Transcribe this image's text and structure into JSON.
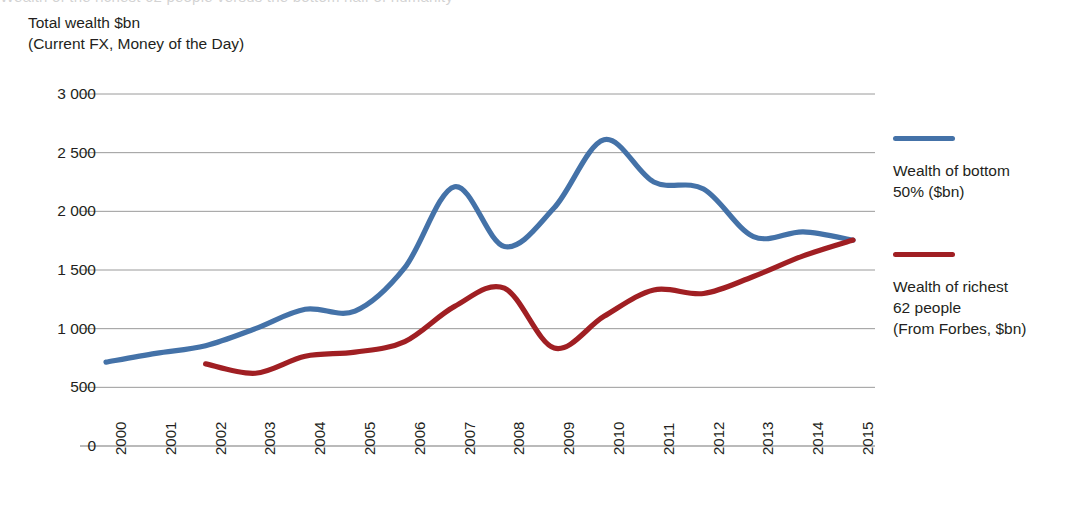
{
  "top_sliver_text": "Wealth of the richest 62 people versus the bottom half of humanity",
  "axis_title": "Total wealth $bn\n(Current FX, Money of the Day)",
  "legend": {
    "entries": [
      {
        "label": "Wealth of bottom\n50% ($bn)",
        "color": "#4472a8",
        "icon": "line-swatch"
      },
      {
        "label": "Wealth of richest\n62 people\n(From Forbes, $bn)",
        "color": "#a01f23",
        "icon": "line-swatch"
      }
    ]
  },
  "chart_data": {
    "type": "line",
    "title": "",
    "subtitle": "",
    "xlabel": "",
    "ylabel": "Total wealth $bn (Current FX, Money of the Day)",
    "x": [
      "2000",
      "2001",
      "2002",
      "2003",
      "2004",
      "2005",
      "2006",
      "2007",
      "2008",
      "2009",
      "2010",
      "2011",
      "2012",
      "2013",
      "2014",
      "2015"
    ],
    "xtick_labels": [
      "2000",
      "2001",
      "2002",
      "2003",
      "2004",
      "2005",
      "2006",
      "2007",
      "2008",
      "2009",
      "2010",
      "2011",
      "2012",
      "2013",
      "2014",
      "2015"
    ],
    "ytick_labels": [
      "0",
      "500",
      "1 000",
      "1 500",
      "2 000",
      "2 500",
      "3 000"
    ],
    "ytick_values": [
      0,
      500,
      1000,
      1500,
      2000,
      2500,
      3000
    ],
    "ylim": [
      0,
      3000
    ],
    "grid": "horizontal",
    "legend_position": "right",
    "series": [
      {
        "name": "Wealth of bottom 50% ($bn)",
        "color": "#4472a8",
        "values": [
          715,
          790,
          855,
          1000,
          1165,
          1150,
          1520,
          2210,
          1700,
          2030,
          2610,
          2250,
          2190,
          1785,
          1825,
          1755
        ]
      },
      {
        "name": "Wealth of richest 62 people (From Forbes, $bn)",
        "color": "#a01f23",
        "values": [
          null,
          null,
          700,
          620,
          765,
          800,
          890,
          1190,
          1345,
          835,
          1105,
          1330,
          1300,
          1445,
          1620,
          1755
        ]
      }
    ]
  }
}
